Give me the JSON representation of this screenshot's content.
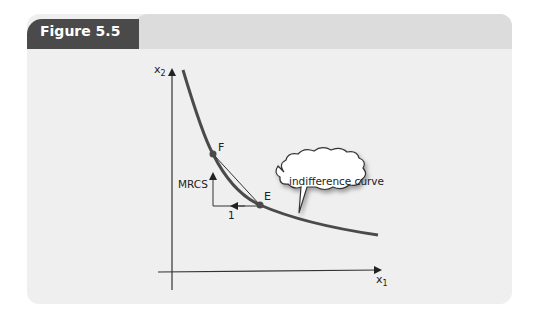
{
  "figure": {
    "title": "Figure 5.5"
  },
  "diagram": {
    "axes": {
      "y_label": "x",
      "y_sub": "2",
      "x_label": "x",
      "x_sub": "1"
    },
    "points": {
      "F": "F",
      "E": "E"
    },
    "annotations": {
      "mrcs": "MRCS",
      "one": "1",
      "callout": "indifference curve"
    },
    "colors": {
      "curve": "#4a4a4a",
      "tab": "#4a4a4a",
      "panel": "#efefef",
      "header": "#dcdcdc"
    }
  }
}
